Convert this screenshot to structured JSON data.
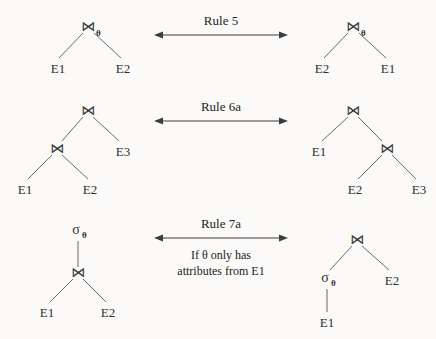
{
  "figure": {
    "background_color": "#fbfaf8",
    "line_color": "#5a5a5a",
    "text_color": "#2b2b2b"
  },
  "symbols": {
    "join": "⋈",
    "select": "σ",
    "theta": "θ"
  },
  "rules": [
    {
      "id": "rule-5",
      "label": "Rule 5",
      "condition_line1": "",
      "condition_line2": "",
      "arrow": "double-headed",
      "left": {
        "root_op": "⋈",
        "root_subscript": "θ",
        "leaves": [
          "E1",
          "E2"
        ]
      },
      "right": {
        "root_op": "⋈",
        "root_subscript": "θ",
        "leaves": [
          "E2",
          "E1"
        ]
      }
    },
    {
      "id": "rule-6a",
      "label": "Rule 6a",
      "condition_line1": "",
      "condition_line2": "",
      "arrow": "double-headed",
      "left": {
        "root_op": "⋈",
        "inner_op": "⋈",
        "leaves": [
          "E1",
          "E2",
          "E3"
        ],
        "shape": "left-deep"
      },
      "right": {
        "root_op": "⋈",
        "inner_op": "⋈",
        "leaves": [
          "E1",
          "E2",
          "E3"
        ],
        "shape": "right-deep"
      }
    },
    {
      "id": "rule-7a",
      "label": "Rule 7a",
      "condition_line1": "If θ only has",
      "condition_line2": "attributes from E1",
      "arrow": "double-headed",
      "left": {
        "root_op": "σ",
        "root_subscript": "θ",
        "inner_op": "⋈",
        "leaves": [
          "E1",
          "E2"
        ]
      },
      "right": {
        "root_op": "⋈",
        "select_op": "σ",
        "select_subscript": "θ",
        "leaves": [
          "E1",
          "E2"
        ]
      }
    }
  ]
}
